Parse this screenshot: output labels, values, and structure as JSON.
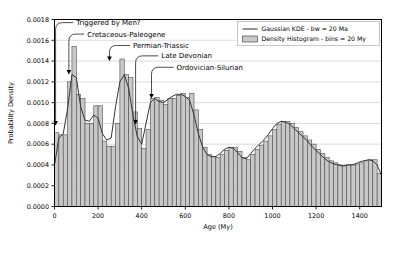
{
  "chart_data": {
    "type": "bar",
    "title": "",
    "xlabel": "Age (My)",
    "ylabel": "Probability Density",
    "xlim": [
      0,
      1500
    ],
    "ylim": [
      0.0,
      0.0018
    ],
    "grid": true,
    "xticks": [
      0,
      200,
      400,
      600,
      800,
      1000,
      1200,
      1400
    ],
    "yticks": [
      0.0,
      0.0002,
      0.0004,
      0.0006,
      0.0008,
      0.001,
      0.0012,
      0.0014,
      0.0016,
      0.0018
    ],
    "ytick_labels": [
      "0.0000",
      "0.0002",
      "0.0004",
      "0.0006",
      "0.0008",
      "0.0010",
      "0.0012",
      "0.0014",
      "0.0016",
      "0.0018"
    ],
    "xtick_labels": [
      "0",
      "200",
      "400",
      "600",
      "800",
      "1000",
      "1200",
      "1400"
    ],
    "bin_width": 20,
    "bin_starts": [
      0,
      20,
      40,
      60,
      80,
      100,
      120,
      140,
      160,
      180,
      200,
      220,
      240,
      260,
      280,
      300,
      320,
      340,
      360,
      380,
      400,
      420,
      440,
      460,
      480,
      500,
      520,
      540,
      560,
      580,
      600,
      620,
      640,
      660,
      680,
      700,
      720,
      740,
      760,
      780,
      800,
      820,
      840,
      860,
      880,
      900,
      920,
      940,
      960,
      980,
      1000,
      1020,
      1040,
      1060,
      1080,
      1100,
      1120,
      1140,
      1160,
      1180,
      1200,
      1220,
      1240,
      1260,
      1280,
      1300,
      1320,
      1340,
      1360,
      1380,
      1400,
      1420,
      1440,
      1460,
      1480
    ],
    "values": [
      0.00071,
      0.00069,
      0.00069,
      0.0012,
      0.00154,
      0.00108,
      0.00104,
      0.0008,
      0.0008,
      0.00097,
      0.00097,
      0.00063,
      0.00058,
      0.00058,
      0.0008,
      0.00142,
      0.00127,
      0.00124,
      0.00091,
      0.00075,
      0.00056,
      0.00074,
      0.00104,
      0.00105,
      0.00102,
      0.00098,
      0.00104,
      0.00104,
      0.00107,
      0.00109,
      0.00105,
      0.00109,
      0.00093,
      0.00074,
      0.00057,
      0.0005,
      0.00048,
      0.00047,
      0.0005,
      0.00054,
      0.00057,
      0.00057,
      0.00053,
      0.00047,
      0.00045,
      0.0005,
      0.00055,
      0.00059,
      0.00063,
      0.00068,
      0.00074,
      0.00079,
      0.00082,
      0.00082,
      0.0008,
      0.00076,
      0.00072,
      0.00068,
      0.00064,
      0.0006,
      0.00055,
      0.00051,
      0.00047,
      0.00044,
      0.00042,
      0.0004,
      0.00039,
      0.0004,
      0.0004,
      0.00041,
      0.00042,
      0.00044,
      0.00045,
      0.00045,
      0.00032
    ],
    "series": [
      {
        "name": "Gaussian KDE - bw = 20 Ma",
        "type": "line",
        "x": [
          0,
          20,
          40,
          60,
          80,
          100,
          120,
          140,
          160,
          180,
          200,
          220,
          240,
          260,
          280,
          300,
          320,
          340,
          360,
          380,
          400,
          420,
          440,
          460,
          480,
          500,
          520,
          540,
          560,
          580,
          600,
          620,
          640,
          660,
          680,
          700,
          720,
          740,
          760,
          780,
          800,
          820,
          840,
          860,
          880,
          900,
          920,
          940,
          960,
          980,
          1000,
          1020,
          1040,
          1060,
          1080,
          1100,
          1120,
          1140,
          1160,
          1180,
          1200,
          1220,
          1240,
          1260,
          1280,
          1300,
          1320,
          1340,
          1360,
          1380,
          1400,
          1420,
          1440,
          1460,
          1480,
          1500
        ],
        "y": [
          0.0004,
          0.00066,
          0.0007,
          0.00094,
          0.00127,
          0.00124,
          0.00096,
          0.00083,
          0.00082,
          0.00088,
          0.00085,
          0.0007,
          0.00064,
          0.00066,
          0.00096,
          0.0012,
          0.00127,
          0.00114,
          0.00088,
          0.00067,
          0.0006,
          0.0008,
          0.001,
          0.00104,
          0.00101,
          0.001,
          0.00103,
          0.00106,
          0.00108,
          0.00108,
          0.00106,
          0.00102,
          0.00088,
          0.0007,
          0.00057,
          0.0005,
          0.00048,
          0.00048,
          0.00051,
          0.00055,
          0.00057,
          0.00056,
          0.00052,
          0.00047,
          0.00046,
          0.00051,
          0.00056,
          0.0006,
          0.00064,
          0.00069,
          0.00075,
          0.0008,
          0.00082,
          0.00081,
          0.00079,
          0.00075,
          0.00071,
          0.00067,
          0.00063,
          0.00058,
          0.00054,
          0.0005,
          0.00046,
          0.00043,
          0.00041,
          0.0004,
          0.00039,
          0.0004,
          0.0004,
          0.00041,
          0.00043,
          0.00044,
          0.00045,
          0.00044,
          0.0004,
          0.0003
        ]
      }
    ],
    "legend": {
      "position": "upper right",
      "entries": [
        {
          "label": "Gaussian KDE - bw = 20 Ma",
          "marker": "line",
          "color": "#404040"
        },
        {
          "label": "Density Histogram - bins = 20 My",
          "marker": "patch",
          "color": "#c8c8c8"
        }
      ]
    },
    "annotations": [
      {
        "label": "Triggered by Men?",
        "x": 5,
        "y": 0.00078,
        "text_x": 100,
        "text_y": 0.00177
      },
      {
        "label": "Cretaceous-Paleogene",
        "x": 66,
        "y": 0.00127,
        "text_x": 150,
        "text_y": 0.00166
      },
      {
        "label": "Permian-Triassic",
        "x": 252,
        "y": 0.0014,
        "text_x": 360,
        "text_y": 0.00155
      },
      {
        "label": "Late Devonian",
        "x": 372,
        "y": 0.00079,
        "text_x": 490,
        "text_y": 0.00145
      },
      {
        "label": "Ordovician-Silurian",
        "x": 445,
        "y": 0.00104,
        "text_x": 560,
        "text_y": 0.00134
      }
    ],
    "colors": {
      "bar_face": "#c8c8c8",
      "bar_edge": "#4d4d4d",
      "kde_line": "#333333",
      "grid": "#cccccc",
      "axis": "#000000",
      "background": "#ffffff"
    }
  }
}
